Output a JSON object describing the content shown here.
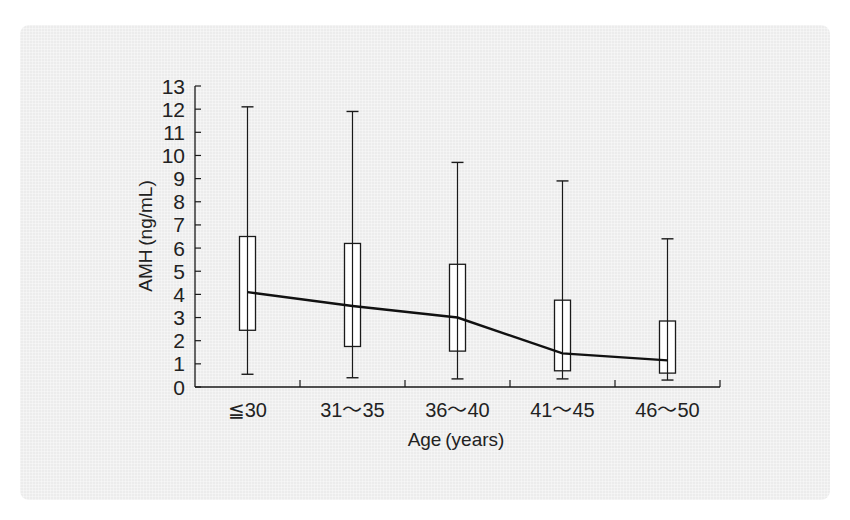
{
  "chart_data": {
    "type": "box",
    "title": "",
    "xlabel": "Age (years)",
    "ylabel": "AMH (ng/mL)",
    "ylim": [
      0,
      13
    ],
    "yticks": [
      0,
      1,
      2,
      3,
      4,
      5,
      6,
      7,
      8,
      9,
      10,
      11,
      12,
      13
    ],
    "grid": false,
    "legend": null,
    "categories": [
      "≦30",
      "31〜35",
      "36〜40",
      "41〜45",
      "46〜50"
    ],
    "series": [
      {
        "name": "whisker_max",
        "values": [
          12.1,
          11.9,
          9.7,
          8.9,
          6.4
        ]
      },
      {
        "name": "q3",
        "values": [
          6.5,
          6.2,
          5.3,
          3.75,
          2.85
        ]
      },
      {
        "name": "median",
        "values": [
          4.1,
          3.5,
          3.0,
          1.45,
          1.15
        ]
      },
      {
        "name": "q1",
        "values": [
          2.45,
          1.75,
          1.55,
          0.7,
          0.6
        ]
      },
      {
        "name": "whisker_min",
        "values": [
          0.55,
          0.4,
          0.35,
          0.35,
          0.3
        ]
      }
    ],
    "median_line": true
  },
  "labels": {
    "ylabel": "AMH (ng/mL)",
    "xlabel": "Age (years)"
  },
  "colors": {
    "panel": "#ececec",
    "line": "#1a1a1a",
    "box_fill": "#ffffff"
  }
}
